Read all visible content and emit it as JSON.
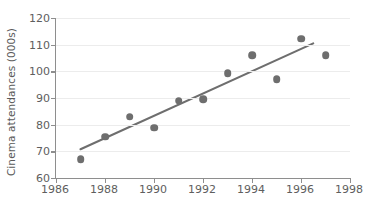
{
  "chart_data": {
    "type": "scatter",
    "title": "",
    "xlabel": "",
    "ylabel": "Cinema attendances (000s)",
    "xlim": [
      1986,
      1998
    ],
    "ylim": [
      60,
      120
    ],
    "xticks": [
      1986,
      1988,
      1990,
      1992,
      1994,
      1996,
      1998
    ],
    "yticks": [
      60,
      70,
      80,
      90,
      100,
      110,
      120
    ],
    "grid": "horizontal",
    "legend": "none",
    "x": [
      1987,
      1988,
      1989,
      1990,
      1991,
      1992,
      1993,
      1994,
      1995,
      1996,
      1997
    ],
    "values": [
      67,
      75.5,
      83,
      78.8,
      89,
      89.5,
      99.3,
      106,
      97,
      112.3,
      106
    ],
    "series": [
      {
        "name": "Cinema attendances",
        "marker": "circle",
        "color": "#6e6e6e",
        "points": [
          {
            "x": 1987,
            "y": 67
          },
          {
            "x": 1988,
            "y": 75.5
          },
          {
            "x": 1989,
            "y": 83
          },
          {
            "x": 1990,
            "y": 78.8
          },
          {
            "x": 1991,
            "y": 89
          },
          {
            "x": 1992,
            "y": 89.5
          },
          {
            "x": 1993,
            "y": 99.3
          },
          {
            "x": 1994,
            "y": 106
          },
          {
            "x": 1995,
            "y": 97
          },
          {
            "x": 1996,
            "y": 112.3
          },
          {
            "x": 1997,
            "y": 106
          }
        ]
      }
    ],
    "trendline": {
      "name": "line of best fit",
      "color": "#6e6e6e",
      "x_start": 1987,
      "y_start": 70.8,
      "x_end": 1996.5,
      "y_end": 110.5
    },
    "colors": {
      "marker": "#6e6e6e",
      "trendline": "#6e6e6e",
      "axis": "#8e8e8e",
      "gridline": "#ececec",
      "text": "#5e5e5e",
      "background": "#ffffff"
    }
  }
}
